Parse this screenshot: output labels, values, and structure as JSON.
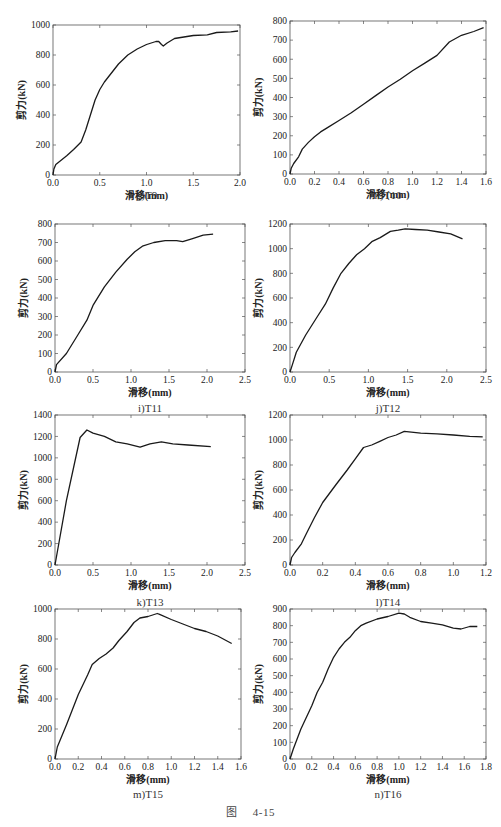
{
  "figure": {
    "label": "图",
    "number": "4-15"
  },
  "chart_data": [
    {
      "id": "g",
      "type": "line",
      "caption": "g)T9",
      "xlabel": "滑移(mm)",
      "ylabel": "剪力(kN)",
      "xlim": [
        0,
        2.0
      ],
      "ylim": [
        0,
        1000
      ],
      "xticks": [
        0.0,
        0.5,
        1.0,
        1.5,
        2.0
      ],
      "xtick_labels": [
        "0.0",
        "0.5",
        "1.0",
        "1.5",
        "2.0"
      ],
      "yticks": [
        0,
        200,
        400,
        600,
        800,
        1000
      ],
      "ytick_labels": [
        "0",
        "200",
        "400",
        "600",
        "800",
        "1000"
      ],
      "x": [
        0,
        0.01,
        0.03,
        0.08,
        0.15,
        0.22,
        0.3,
        0.35,
        0.4,
        0.45,
        0.5,
        0.55,
        0.6,
        0.7,
        0.8,
        0.9,
        1.0,
        1.1,
        1.13,
        1.16,
        1.18,
        1.22,
        1.3,
        1.4,
        1.5,
        1.65,
        1.75,
        1.9,
        1.98
      ],
      "y": [
        0,
        40,
        70,
        95,
        130,
        170,
        220,
        300,
        400,
        500,
        570,
        620,
        660,
        740,
        800,
        840,
        870,
        890,
        890,
        870,
        860,
        880,
        910,
        920,
        930,
        935,
        950,
        955,
        960
      ]
    },
    {
      "id": "h",
      "type": "line",
      "caption": "h)T10",
      "xlabel": "滑移(mm)",
      "ylabel": "剪力(kN)",
      "xlim": [
        0,
        1.6
      ],
      "ylim": [
        0,
        800
      ],
      "xticks": [
        0.0,
        0.2,
        0.4,
        0.6,
        0.8,
        1.0,
        1.2,
        1.4,
        1.6
      ],
      "xtick_labels": [
        "0.0",
        "0.2",
        "0.4",
        "0.6",
        "0.8",
        "1.0",
        "1.2",
        "1.4",
        "1.6"
      ],
      "yticks": [
        0,
        100,
        200,
        300,
        400,
        500,
        600,
        700,
        800
      ],
      "ytick_labels": [
        "0",
        "100",
        "200",
        "300",
        "400",
        "500",
        "600",
        "700",
        "800"
      ],
      "x": [
        0,
        0.01,
        0.03,
        0.07,
        0.1,
        0.15,
        0.2,
        0.25,
        0.3,
        0.4,
        0.5,
        0.6,
        0.7,
        0.8,
        0.9,
        1.0,
        1.1,
        1.2,
        1.3,
        1.4,
        1.5,
        1.58
      ],
      "y": [
        0,
        30,
        55,
        90,
        130,
        165,
        195,
        220,
        240,
        280,
        320,
        365,
        410,
        455,
        495,
        540,
        580,
        620,
        690,
        725,
        745,
        765
      ]
    },
    {
      "id": "i",
      "type": "line",
      "caption": "i)T11",
      "xlabel": "滑移(mm)",
      "ylabel": "剪力(kN)",
      "xlim": [
        0,
        2.5
      ],
      "ylim": [
        0,
        800
      ],
      "xticks": [
        0.0,
        0.5,
        1.0,
        1.5,
        2.0,
        2.5
      ],
      "xtick_labels": [
        "0.0",
        "0.5",
        "1.0",
        "1.5",
        "2.0",
        "2.5"
      ],
      "yticks": [
        0,
        100,
        200,
        300,
        400,
        500,
        600,
        700,
        800
      ],
      "ytick_labels": [
        "0",
        "100",
        "200",
        "300",
        "400",
        "500",
        "600",
        "700",
        "800"
      ],
      "x": [
        0,
        0.02,
        0.15,
        0.3,
        0.42,
        0.5,
        0.65,
        0.8,
        0.95,
        1.05,
        1.15,
        1.3,
        1.45,
        1.6,
        1.68,
        1.8,
        1.95,
        2.08
      ],
      "y": [
        0,
        40,
        100,
        200,
        280,
        360,
        460,
        540,
        610,
        650,
        680,
        700,
        710,
        710,
        705,
        720,
        740,
        745
      ]
    },
    {
      "id": "j",
      "type": "line",
      "caption": "j)T12",
      "xlabel": "滑移(mm)",
      "ylabel": "剪力(kN)",
      "xlim": [
        0,
        2.5
      ],
      "ylim": [
        0,
        1200
      ],
      "xticks": [
        0.0,
        0.5,
        1.0,
        1.5,
        2.0,
        2.5
      ],
      "xtick_labels": [
        "0.0",
        "0.5",
        "1.0",
        "1.5",
        "2.0",
        "2.5"
      ],
      "yticks": [
        0,
        200,
        400,
        600,
        800,
        1000,
        1200
      ],
      "ytick_labels": [
        "0",
        "200",
        "400",
        "600",
        "800",
        "1000",
        "1200"
      ],
      "x": [
        0,
        0.03,
        0.08,
        0.2,
        0.35,
        0.45,
        0.55,
        0.65,
        0.75,
        0.85,
        0.95,
        1.05,
        1.15,
        1.28,
        1.38,
        1.47,
        1.6,
        1.75,
        1.9,
        2.05,
        2.2
      ],
      "y": [
        0,
        60,
        160,
        300,
        450,
        550,
        680,
        800,
        880,
        950,
        1000,
        1060,
        1090,
        1140,
        1150,
        1160,
        1155,
        1150,
        1135,
        1120,
        1080
      ]
    },
    {
      "id": "k",
      "type": "line",
      "caption": "k)T13",
      "xlabel": "滑移(mm)",
      "ylabel": "剪力(kN)",
      "xlim": [
        0,
        2.5
      ],
      "ylim": [
        0,
        1400
      ],
      "xticks": [
        0.0,
        0.5,
        1.0,
        1.5,
        2.0,
        2.5
      ],
      "xtick_labels": [
        "0.0",
        "0.5",
        "1.0",
        "1.5",
        "2.0",
        "2.5"
      ],
      "yticks": [
        0,
        200,
        400,
        600,
        800,
        1000,
        1200,
        1400
      ],
      "ytick_labels": [
        "0",
        "200",
        "400",
        "600",
        "800",
        "1000",
        "1200",
        "1400"
      ],
      "x": [
        0,
        0.15,
        0.33,
        0.42,
        0.5,
        0.65,
        0.8,
        0.95,
        1.12,
        1.25,
        1.4,
        1.55,
        1.75,
        2.05
      ],
      "y": [
        0,
        600,
        1190,
        1260,
        1230,
        1200,
        1150,
        1130,
        1100,
        1130,
        1150,
        1130,
        1120,
        1105
      ]
    },
    {
      "id": "l",
      "type": "line",
      "caption": "l)T14",
      "xlabel": "滑移(mm)",
      "ylabel": "剪力(kN)",
      "xlim": [
        0,
        1.2
      ],
      "ylim": [
        0,
        1200
      ],
      "xticks": [
        0.0,
        0.2,
        0.4,
        0.6,
        0.8,
        1.0,
        1.2
      ],
      "xtick_labels": [
        "0.0",
        "0.2",
        "0.4",
        "0.6",
        "0.8",
        "1.0",
        "1.2"
      ],
      "yticks": [
        0,
        200,
        400,
        600,
        800,
        1000,
        1200
      ],
      "ytick_labels": [
        "0",
        "200",
        "400",
        "600",
        "800",
        "1000",
        "1200"
      ],
      "x": [
        0,
        0.01,
        0.03,
        0.07,
        0.1,
        0.15,
        0.2,
        0.28,
        0.35,
        0.4,
        0.45,
        0.5,
        0.55,
        0.6,
        0.65,
        0.7,
        0.8,
        0.9,
        1.0,
        1.1,
        1.18
      ],
      "y": [
        0,
        60,
        100,
        170,
        250,
        380,
        500,
        640,
        760,
        850,
        940,
        960,
        990,
        1020,
        1040,
        1070,
        1055,
        1050,
        1040,
        1030,
        1025
      ]
    },
    {
      "id": "m",
      "type": "line",
      "caption": "m)T15",
      "xlabel": "滑移(mm)",
      "ylabel": "剪力(kN)",
      "xlim": [
        0,
        1.6
      ],
      "ylim": [
        0,
        1000
      ],
      "xticks": [
        0.0,
        0.2,
        0.4,
        0.6,
        0.8,
        1.0,
        1.2,
        1.4,
        1.6
      ],
      "xtick_labels": [
        "0.0",
        "0.2",
        "0.4",
        "0.6",
        "0.8",
        "1.0",
        "1.2",
        "1.4",
        "1.6"
      ],
      "yticks": [
        0,
        200,
        400,
        600,
        800,
        1000
      ],
      "ytick_labels": [
        "0",
        "200",
        "400",
        "600",
        "800",
        "1000"
      ],
      "x": [
        0,
        0.02,
        0.1,
        0.2,
        0.28,
        0.32,
        0.38,
        0.44,
        0.5,
        0.55,
        0.62,
        0.68,
        0.73,
        0.8,
        0.88,
        0.9,
        1.0,
        1.1,
        1.2,
        1.3,
        1.4,
        1.52
      ],
      "y": [
        0,
        80,
        230,
        430,
        560,
        630,
        670,
        700,
        740,
        790,
        850,
        910,
        940,
        950,
        970,
        965,
        930,
        900,
        870,
        850,
        820,
        770
      ]
    },
    {
      "id": "n",
      "type": "line",
      "caption": "n)T16",
      "xlabel": "滑移(mm)",
      "ylabel": "剪力(kN)",
      "xlim": [
        0,
        1.8
      ],
      "ylim": [
        0,
        900
      ],
      "xticks": [
        0.0,
        0.2,
        0.4,
        0.6,
        0.8,
        1.0,
        1.2,
        1.4,
        1.6,
        1.8
      ],
      "xtick_labels": [
        "0.0",
        "0.2",
        "0.4",
        "0.6",
        "0.8",
        "1.0",
        "1.2",
        "1.4",
        "1.6",
        "1.8"
      ],
      "yticks": [
        0,
        100,
        200,
        300,
        400,
        500,
        600,
        700,
        800,
        900
      ],
      "ytick_labels": [
        "0",
        "100",
        "200",
        "300",
        "400",
        "500",
        "600",
        "700",
        "800",
        "900"
      ],
      "x": [
        0,
        0.03,
        0.1,
        0.2,
        0.25,
        0.3,
        0.35,
        0.4,
        0.45,
        0.5,
        0.55,
        0.6,
        0.65,
        0.7,
        0.8,
        0.9,
        1.0,
        1.05,
        1.1,
        1.2,
        1.3,
        1.4,
        1.5,
        1.57,
        1.65,
        1.72
      ],
      "y": [
        0,
        60,
        180,
        320,
        400,
        460,
        540,
        610,
        660,
        700,
        730,
        770,
        800,
        815,
        840,
        855,
        875,
        870,
        850,
        825,
        815,
        805,
        785,
        780,
        795,
        795
      ]
    }
  ]
}
